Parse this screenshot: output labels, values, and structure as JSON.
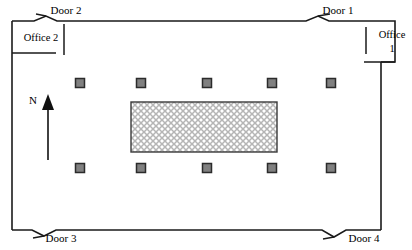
{
  "diagram": {
    "type": "floor-plan",
    "background_color": "#ffffff",
    "wall_color": "#1a1a1a",
    "canvas": {
      "width": 412,
      "height": 250
    }
  },
  "doors": [
    {
      "id": "door-2",
      "label": "Door 2",
      "wall": "top",
      "label_x": 66,
      "label_y": 11,
      "swing_x": 34,
      "swing_y": 21
    },
    {
      "id": "door-1",
      "label": "Door 1",
      "wall": "top",
      "label_x": 338,
      "label_y": 11,
      "swing_x": 313,
      "swing_y": 21
    },
    {
      "id": "door-3",
      "label": "Door 3",
      "wall": "bottom",
      "label_x": 61,
      "label_y": 239,
      "swing_x": 32,
      "swing_y": 230
    },
    {
      "id": "door-4",
      "label": "Door 4",
      "wall": "bottom",
      "label_x": 364,
      "label_y": 239,
      "swing_x": 335,
      "swing_y": 231
    }
  ],
  "offices": [
    {
      "id": "office-2",
      "label": "Office 2",
      "label_x": 41,
      "label_y": 39,
      "corner": "top-left"
    },
    {
      "id": "office-1",
      "label": "Office",
      "label_x": 392,
      "label_y": 36,
      "corner": "top-right",
      "number": "1",
      "number_x": 392,
      "number_y": 50
    }
  ],
  "compass": {
    "label": "N",
    "direction": "up",
    "label_x": 33,
    "label_y": 101,
    "arrow_x": 48,
    "arrow_tip_y": 95,
    "arrow_base_y": 160
  },
  "columns": {
    "fill_color": "#808080",
    "stroke_color": "#2b2b2b",
    "size": 9,
    "top_row_y": 83,
    "bottom_row_y": 168,
    "x_positions": [
      80,
      141,
      207,
      272,
      331
    ],
    "count": 10
  },
  "obstruction": {
    "id": "central-obstruction",
    "x": 131,
    "y": 102,
    "width": 146,
    "height": 50,
    "pattern": "cross-hatch",
    "pattern_color": "#b5b5b5",
    "outline_color": "#3a3a3a"
  }
}
